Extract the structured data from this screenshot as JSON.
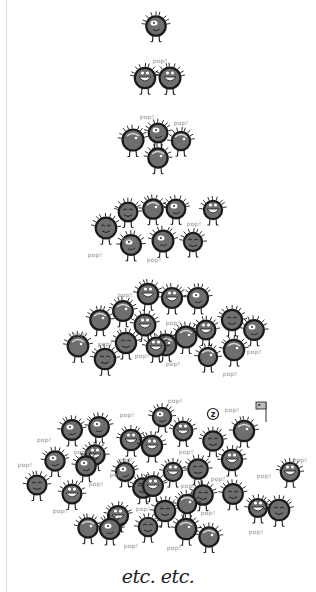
{
  "illustration": {
    "description": "Doubling population of spiky round creatures, each tier twice the previous",
    "colors": {
      "background": "#ffffff",
      "body": "#6e6e6e",
      "outline": "#1a1a1a",
      "highlight": "#ffffff",
      "caption": "#8a8a8a",
      "border": "#d9d9d9"
    },
    "tiers": [
      {
        "count": 1,
        "creatures": [
          [
            156,
            26
          ]
        ]
      },
      {
        "count": 2,
        "creatures": [
          [
            145,
            78
          ],
          [
            170,
            78
          ]
        ]
      },
      {
        "count": 4,
        "creatures": [
          [
            133,
            140
          ],
          [
            158,
            133
          ],
          [
            181,
            141
          ],
          [
            158,
            158
          ]
        ]
      },
      {
        "count": 8,
        "creatures": [
          [
            106,
            228
          ],
          [
            128,
            212
          ],
          [
            153,
            209
          ],
          [
            176,
            209
          ],
          [
            213,
            210
          ],
          [
            131,
            245
          ],
          [
            163,
            241
          ],
          [
            193,
            242
          ]
        ]
      },
      {
        "count": 16,
        "creatures": [
          [
            100,
            320
          ],
          [
            123,
            311
          ],
          [
            148,
            294
          ],
          [
            172,
            298
          ],
          [
            198,
            298
          ],
          [
            145,
            325
          ],
          [
            126,
            343
          ],
          [
            166,
            345
          ],
          [
            186,
            337
          ],
          [
            206,
            330
          ],
          [
            232,
            320
          ],
          [
            254,
            330
          ],
          [
            78,
            346
          ],
          [
            105,
            359
          ],
          [
            156,
            347
          ],
          [
            208,
            357
          ],
          [
            234,
            350
          ]
        ]
      },
      {
        "count": 32,
        "creatures": [
          [
            72,
            430
          ],
          [
            99,
            427
          ],
          [
            162,
            417
          ],
          [
            183,
            431
          ],
          [
            131,
            440
          ],
          [
            213,
            441
          ],
          [
            244,
            431
          ],
          [
            55,
            461
          ],
          [
            95,
            455
          ],
          [
            152,
            446
          ],
          [
            125,
            472
          ],
          [
            198,
            469
          ],
          [
            232,
            460
          ],
          [
            290,
            472
          ],
          [
            37,
            485
          ],
          [
            72,
            494
          ],
          [
            86,
            466
          ],
          [
            143,
            488
          ],
          [
            173,
            472
          ],
          [
            203,
            495
          ],
          [
            153,
            486
          ],
          [
            118,
            516
          ],
          [
            165,
            511
          ],
          [
            187,
            504
          ],
          [
            233,
            494
          ],
          [
            258,
            508
          ],
          [
            279,
            510
          ],
          [
            88,
            528
          ],
          [
            110,
            529
          ],
          [
            148,
            527
          ],
          [
            186,
            529
          ],
          [
            209,
            537
          ]
        ]
      }
    ],
    "captions": [
      {
        "text": "pop!",
        "x": 160,
        "y": 60
      },
      {
        "text": "pop!",
        "x": 147,
        "y": 116
      },
      {
        "text": "pop!",
        "x": 181,
        "y": 122
      },
      {
        "text": "pop!",
        "x": 129,
        "y": 238
      },
      {
        "text": "pop!",
        "x": 194,
        "y": 223
      },
      {
        "text": "pop!",
        "x": 95,
        "y": 254
      },
      {
        "text": "pop!",
        "x": 154,
        "y": 259
      },
      {
        "text": "pop!",
        "x": 125,
        "y": 294
      },
      {
        "text": "pop!",
        "x": 173,
        "y": 322
      },
      {
        "text": "pop!",
        "x": 80,
        "y": 333
      },
      {
        "text": "pop!",
        "x": 105,
        "y": 343
      },
      {
        "text": "pop!",
        "x": 142,
        "y": 355
      },
      {
        "text": "pop!",
        "x": 173,
        "y": 363
      },
      {
        "text": "pop!",
        "x": 254,
        "y": 351
      },
      {
        "text": "pop!",
        "x": 230,
        "y": 373
      },
      {
        "text": "pop!",
        "x": 175,
        "y": 400
      },
      {
        "text": "pop!",
        "x": 127,
        "y": 414
      },
      {
        "text": "pop!",
        "x": 232,
        "y": 409
      },
      {
        "text": "pop!",
        "x": 44,
        "y": 439
      },
      {
        "text": "pop!",
        "x": 81,
        "y": 451
      },
      {
        "text": "pop!",
        "x": 126,
        "y": 459
      },
      {
        "text": "pop!",
        "x": 186,
        "y": 451
      },
      {
        "text": "pop!",
        "x": 25,
        "y": 464
      },
      {
        "text": "pop!",
        "x": 117,
        "y": 474
      },
      {
        "text": "pop!",
        "x": 218,
        "y": 478
      },
      {
        "text": "pop!",
        "x": 300,
        "y": 459
      },
      {
        "text": "pop!",
        "x": 264,
        "y": 475
      },
      {
        "text": "pop!",
        "x": 96,
        "y": 483
      },
      {
        "text": "pop!",
        "x": 188,
        "y": 485
      },
      {
        "text": "pop!",
        "x": 143,
        "y": 508
      },
      {
        "text": "pop!",
        "x": 208,
        "y": 512
      },
      {
        "text": "pop!",
        "x": 60,
        "y": 510
      },
      {
        "text": "pop!",
        "x": 256,
        "y": 531
      },
      {
        "text": "pop!",
        "x": 131,
        "y": 545
      },
      {
        "text": "pop!",
        "x": 174,
        "y": 547
      }
    ],
    "sleep_bubble": {
      "text": "z",
      "x": 213,
      "y": 414
    },
    "flag": {
      "x": 258,
      "y": 404
    },
    "footer_text": "etc. etc."
  }
}
